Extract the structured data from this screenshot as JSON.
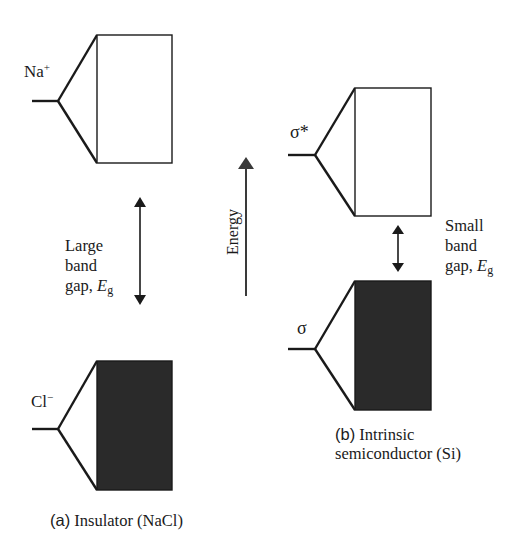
{
  "diagram": {
    "type": "band-structure-comparison",
    "axis": {
      "label": "Energy",
      "direction": "up"
    },
    "panels": [
      {
        "id": "a",
        "caption_prefix": "(a)",
        "caption": "Insulator (NaCl)",
        "upper_level": {
          "label_base": "Na",
          "label_sup": "+",
          "band_fill": "empty"
        },
        "lower_level": {
          "label_base": "Cl",
          "label_sup": "−",
          "band_fill": "filled"
        },
        "gap": {
          "lines": [
            "Large",
            "band"
          ],
          "gap_prefix": "gap, ",
          "symbol": "E",
          "symbol_sub": "g"
        }
      },
      {
        "id": "b",
        "caption_prefix": "(b)",
        "caption_line1": "Intrinsic",
        "caption_line2": "semiconductor (Si)",
        "upper_level": {
          "label": "σ*",
          "band_fill": "empty"
        },
        "lower_level": {
          "label": "σ",
          "band_fill": "filled"
        },
        "gap": {
          "lines": [
            "Small",
            "band"
          ],
          "gap_prefix": "gap, ",
          "symbol": "E",
          "symbol_sub": "g"
        }
      }
    ],
    "colors": {
      "line": "#1a1a1a",
      "filled_band": "#2a2a2a",
      "background": "#ffffff"
    }
  }
}
